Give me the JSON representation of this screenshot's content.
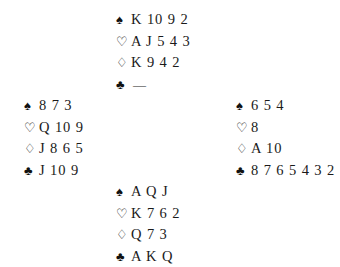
{
  "diagram": {
    "type": "bridge-deal-diagram",
    "background_color": "#ffffff",
    "text_color": "#1a1a1a",
    "void_marker": "—",
    "suits": [
      {
        "key": "spades",
        "symbol": "♠",
        "name": "spade-symbol",
        "style": "filled"
      },
      {
        "key": "hearts",
        "symbol": "♡",
        "name": "heart-symbol",
        "style": "outline"
      },
      {
        "key": "diamonds",
        "symbol": "♢",
        "name": "diamond-symbol",
        "style": "outline"
      },
      {
        "key": "clubs",
        "symbol": "♣",
        "name": "club-symbol",
        "style": "filled"
      }
    ]
  },
  "hands": {
    "north": {
      "position": "North",
      "spades": "K 10 9 2",
      "hearts": "A J 5 4 3",
      "diamonds": "K 9 4 2",
      "clubs": "—"
    },
    "west": {
      "position": "West",
      "spades": "8 7 3",
      "hearts": "Q 10 9",
      "diamonds": "J 8 6 5",
      "clubs": "J 10 9"
    },
    "east": {
      "position": "East",
      "spades": "6 5 4",
      "hearts": "8",
      "diamonds": "A 10",
      "clubs": "8 7 6 5 4 3 2"
    },
    "south": {
      "position": "South",
      "spades": "A Q J",
      "hearts": "K 7 6 2",
      "diamonds": "Q 7 3",
      "clubs": "A K Q"
    }
  }
}
